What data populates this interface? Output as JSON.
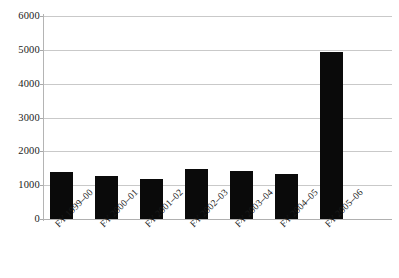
{
  "chart_data": {
    "type": "bar",
    "title": "",
    "subtitle": "",
    "xlabel": "",
    "ylabel": "",
    "categories": [
      "FY 1999–00",
      "FY 2000–01",
      "FY 2001–02",
      "FY 2002–03",
      "FY 2003–04",
      "FY 2004–05",
      "FY 2005–06"
    ],
    "values": [
      1390,
      1270,
      1180,
      1480,
      1430,
      1320,
      4950
    ],
    "ylim": [
      0,
      6000
    ],
    "yticks": [
      0,
      1000,
      2000,
      3000,
      4000,
      5000,
      6000
    ],
    "ytick_labels": [
      "0",
      "1000",
      "2000",
      "3000",
      "4000",
      "5000",
      "6000"
    ],
    "grid": true,
    "grid_axis": "y",
    "legend": false,
    "legend_position": "none",
    "bar_color": "#0a0a0a",
    "gridline_color": "#c9c9c9",
    "axis_color": "#b4b4b4",
    "background_color": "#ffffff",
    "xtick_label_rotation": -45
  }
}
